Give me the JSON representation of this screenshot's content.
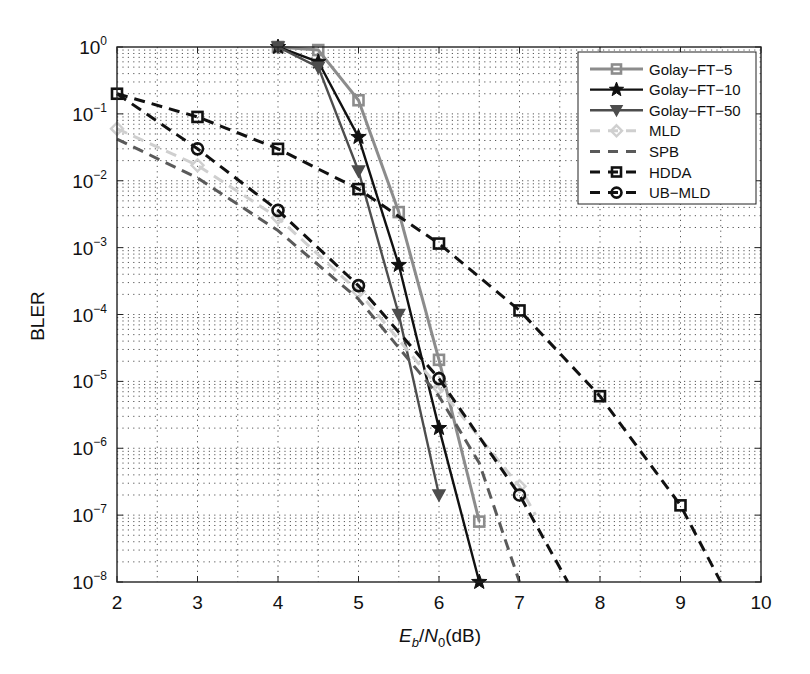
{
  "chart_data": {
    "type": "line",
    "title": "",
    "xlabel": "E_b/N_0(dB)",
    "xlabel_parts": {
      "E": "E",
      "b": "b",
      "slash": "/",
      "N": "N",
      "zero": "0",
      "unit": "(dB)"
    },
    "ylabel": "BLER",
    "xlim": [
      2,
      10
    ],
    "ylim": [
      1e-08,
      1
    ],
    "yscale": "log",
    "grid": true,
    "legend_position": "upper right",
    "x_ticks": [
      "2",
      "3",
      "4",
      "5",
      "6",
      "7",
      "8",
      "9",
      "10"
    ],
    "y_ticks": [
      {
        "base": "10",
        "exp": "0"
      },
      {
        "base": "10",
        "exp": "−1"
      },
      {
        "base": "10",
        "exp": "−2"
      },
      {
        "base": "10",
        "exp": "−3"
      },
      {
        "base": "10",
        "exp": "−4"
      },
      {
        "base": "10",
        "exp": "−5"
      },
      {
        "base": "10",
        "exp": "−6"
      },
      {
        "base": "10",
        "exp": "−7"
      },
      {
        "base": "10",
        "exp": "−8"
      }
    ],
    "series": [
      {
        "name": "Golay−FT−5",
        "color": "#8c8c8c",
        "line": "solid",
        "marker": "square",
        "width": 3,
        "x": [
          4,
          4.5,
          5,
          5.5,
          6,
          6.5
        ],
        "y": [
          1.0,
          0.9,
          0.16,
          0.0034,
          2.1e-05,
          8e-08
        ]
      },
      {
        "name": "Golay−FT−10",
        "color": "#111111",
        "line": "solid",
        "marker": "star",
        "width": 2.4,
        "x": [
          4,
          4.5,
          5,
          5.5,
          6,
          6.5
        ],
        "y": [
          1.0,
          0.6,
          0.045,
          0.00055,
          2e-06,
          1e-08
        ]
      },
      {
        "name": "Golay−FT−50",
        "color": "#4d4d4d",
        "line": "solid",
        "marker": "triangle-down",
        "width": 2.4,
        "x": [
          4,
          4.5,
          5,
          5.5,
          6
        ],
        "y": [
          1.0,
          0.5,
          0.014,
          0.0001,
          2e-07
        ]
      },
      {
        "name": "MLD",
        "color": "#cfcfcf",
        "line": "dashed",
        "marker": "diamond",
        "width": 3,
        "x": [
          2,
          3,
          4,
          5,
          6,
          7,
          7.2
        ],
        "y": [
          0.06,
          0.017,
          0.0028,
          0.00022,
          8e-06,
          2.7e-07,
          1e-07
        ]
      },
      {
        "name": "SPB",
        "color": "#5a5a5a",
        "line": "dashed",
        "marker": "none",
        "width": 3,
        "x": [
          2,
          3,
          4,
          5,
          6,
          6.5,
          7.0
        ],
        "y": [
          0.042,
          0.011,
          0.0018,
          0.00017,
          6e-06,
          6e-07,
          1e-08
        ]
      },
      {
        "name": "HDDA",
        "color": "#111111",
        "line": "dashed",
        "marker": "square",
        "width": 3,
        "x": [
          2,
          3,
          4,
          5,
          6,
          7,
          8,
          9,
          9.5
        ],
        "y": [
          0.2,
          0.09,
          0.03,
          0.0075,
          0.00115,
          0.000115,
          6e-06,
          1.4e-07,
          1e-08
        ]
      },
      {
        "name": "UB−MLD",
        "color": "#111111",
        "line": "dashed",
        "marker": "circle",
        "width": 3,
        "x": [
          2,
          3,
          4,
          5,
          6,
          7,
          7.6
        ],
        "y": [
          0.2,
          0.03,
          0.0036,
          0.00027,
          1.1e-05,
          2e-07,
          1e-08
        ]
      }
    ]
  }
}
